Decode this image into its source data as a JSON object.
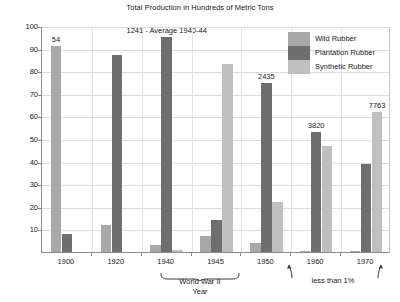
{
  "chart_data": {
    "type": "bar",
    "title": "Total Production in Hundreds of Metric Tons",
    "xlabel": "Year",
    "ylabel": "Percent of Production",
    "ylim": [
      0,
      100
    ],
    "yticks": [
      100,
      90,
      80,
      70,
      60,
      50,
      40,
      30,
      20,
      10
    ],
    "grid": true,
    "legend_position": "top-right",
    "categories": [
      "1900",
      "1920",
      "1940",
      "1945",
      "1950",
      "1960",
      "1970"
    ],
    "series": [
      {
        "name": "Wild Rubber",
        "color": "#a8a8a8",
        "values": [
          91,
          12,
          3,
          7,
          4,
          0.6,
          0.6
        ]
      },
      {
        "name": "Plantation Rubber",
        "color": "#6e6e6e",
        "values": [
          8,
          87,
          95,
          14,
          75,
          53,
          39
        ]
      },
      {
        "name": "Synthetic Rubber",
        "color": "#bfbfbf",
        "values": [
          0,
          0,
          1,
          83,
          22,
          47,
          62
        ]
      }
    ],
    "point_labels": [
      {
        "text": "54",
        "category": "1900",
        "series": "Wild Rubber"
      },
      {
        "text": "1241 - Average 1940-44",
        "category": "1940",
        "series": "Plantation Rubber"
      },
      {
        "text": "2435",
        "category": "1950",
        "series": "Plantation Rubber"
      },
      {
        "text": "3820",
        "category": "1960",
        "series": "Plantation Rubber"
      },
      {
        "text": "7763",
        "category": "1970",
        "series": "Synthetic Rubber"
      }
    ],
    "annotations": [
      {
        "text": "World War II",
        "spans": [
          "1940",
          "1945"
        ]
      },
      {
        "text": "less than 1%",
        "spans": [
          "1960",
          "1970"
        ]
      }
    ]
  },
  "labels": {
    "title": "Total Production in Hundreds of Metric Tons",
    "y_axis": "Percent of Production",
    "x_axis": "Year",
    "ww2": "World War II",
    "less_than_one": "less than 1%"
  },
  "y_ticks": [
    "100",
    "90",
    "80",
    "70",
    "60",
    "50",
    "40",
    "30",
    "20",
    "10"
  ],
  "x_ticks": [
    "1900",
    "1920",
    "1940",
    "1945",
    "1950",
    "1960",
    "1970"
  ],
  "legend": {
    "items": [
      {
        "label": "Wild Rubber",
        "color": "#a8a8a8"
      },
      {
        "label": "Plantation Rubber",
        "color": "#6e6e6e"
      },
      {
        "label": "Synthetic Rubber",
        "color": "#bfbfbf"
      }
    ]
  },
  "bar_labels": {
    "y1900": "54",
    "y1940": "1241 - Average 1940-44",
    "y1950": "2435",
    "y1960": "3820",
    "y1970": "7763"
  },
  "colors": {
    "wild": "#a8a8a8",
    "plantation": "#6e6e6e",
    "synthetic": "#bfbfbf",
    "grid": "#dcdcdc",
    "axis": "#8a8a8a"
  }
}
